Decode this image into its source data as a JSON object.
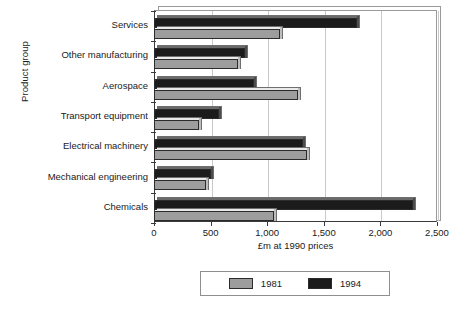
{
  "chart_data": {
    "type": "bar",
    "orientation": "horizontal",
    "title": "",
    "xlabel": "£m at 1990 prices",
    "ylabel": "Product group",
    "categories": [
      "Services",
      "Other manufacturing",
      "Aerospace",
      "Transport equipment",
      "Electrical machinery",
      "Mechanical engineering",
      "Chemicals"
    ],
    "series": [
      {
        "name": "1981",
        "color": "#9d9d9d",
        "values": [
          1110,
          740,
          1270,
          400,
          1350,
          455,
          1060
        ]
      },
      {
        "name": "1994",
        "color": "#1b1b1b",
        "values": [
          1790,
          800,
          880,
          570,
          1320,
          500,
          2290
        ]
      }
    ],
    "xlim": [
      0,
      2500
    ],
    "xticks": [
      0,
      500,
      1000,
      1500,
      2000,
      2500
    ],
    "xtick_labels": [
      "0",
      "500",
      "1,000",
      "1,500",
      "2,000",
      "2,500"
    ],
    "grid": "vertical",
    "legend_position": "bottom-center",
    "legend_entries": [
      "1981",
      "1994"
    ]
  }
}
